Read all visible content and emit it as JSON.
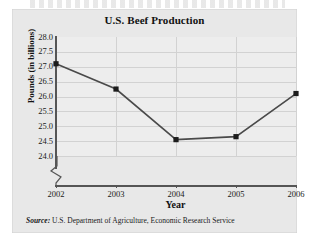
{
  "figure": {
    "title": "U.S. Beef Production",
    "source_prefix": "Source:",
    "source_text": "U.S. Department of Agriculture, Economic Research Service"
  },
  "chart_data": {
    "type": "line",
    "title": "U.S. Beef Production",
    "xlabel": "Year",
    "ylabel": "Pounds (in billions)",
    "categories": [
      "2002",
      "2003",
      "2004",
      "2005",
      "2006"
    ],
    "x": [
      2002,
      2003,
      2004,
      2005,
      2006
    ],
    "values": [
      27.1,
      26.25,
      24.55,
      24.65,
      26.1
    ],
    "series": [
      {
        "name": "U.S. Beef Production",
        "values": [
          27.1,
          26.25,
          24.55,
          24.65,
          26.1
        ]
      }
    ],
    "ylim": [
      24.0,
      28.0
    ],
    "yticks": [
      "28.0",
      "27.5",
      "27.0",
      "26.5",
      "26.0",
      "25.5",
      "25.0",
      "24.5",
      "24.0"
    ],
    "ytick_values": [
      28.0,
      27.5,
      27.0,
      26.5,
      26.0,
      25.5,
      25.0,
      24.5,
      24.0
    ],
    "xticks": [
      "2002",
      "2003",
      "2004",
      "2005",
      "2006"
    ],
    "grid": true,
    "legend": "none",
    "y_axis_break": true,
    "marker": "filled-square",
    "line_color": "#4a4a4a",
    "marker_color": "#1c1c1c",
    "grid_color": "#d2d2d2",
    "plot_background": "#ededed",
    "panel_background": "#e8e8e8"
  }
}
